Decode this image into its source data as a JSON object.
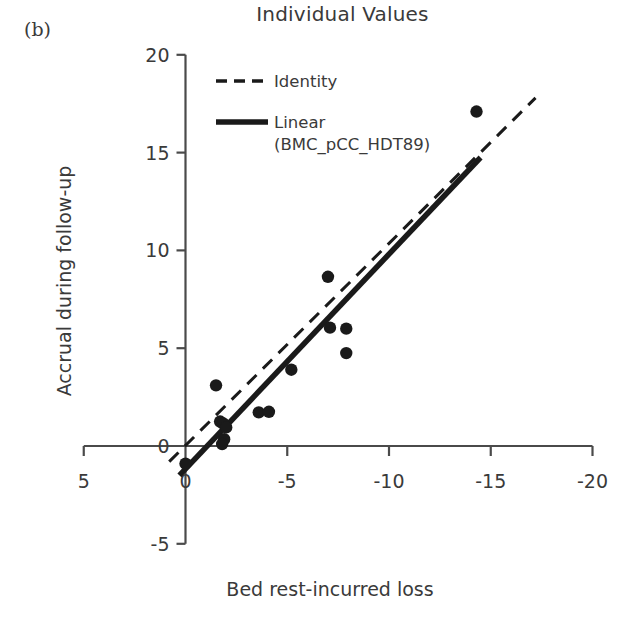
{
  "panel_label": "(b)",
  "chart_data": {
    "type": "scatter",
    "title": "Individual Values",
    "xlabel": "Bed rest-incurred loss",
    "ylabel": "Accrual during follow-up",
    "xlim": [
      5,
      -20
    ],
    "ylim": [
      -5,
      20
    ],
    "xticks": [
      5,
      0,
      -5,
      -10,
      -15,
      -20
    ],
    "xtick_labels": [
      "5",
      "0",
      "-5",
      "-10",
      "-15",
      "-20"
    ],
    "yticks": [
      20,
      15,
      10,
      5,
      0,
      -5
    ],
    "ytick_labels": [
      "20",
      "15",
      "10",
      "5",
      "0",
      "-5"
    ],
    "grid": false,
    "axis_direction": "x-reversed",
    "legend_position": "top-left-inside",
    "marker": "filled-circle",
    "marker_color": "#1a1a1a",
    "line_color": "#1a1a1a",
    "series": [
      {
        "name": "Individual Values",
        "type": "scatter",
        "points": [
          {
            "x": 0.0,
            "y": -0.9
          },
          {
            "x": -1.5,
            "y": 3.1
          },
          {
            "x": -1.7,
            "y": 1.25
          },
          {
            "x": -1.85,
            "y": 1.15
          },
          {
            "x": -2.0,
            "y": 0.95
          },
          {
            "x": -1.9,
            "y": 0.35
          },
          {
            "x": -1.8,
            "y": 0.1
          },
          {
            "x": -3.6,
            "y": 1.72
          },
          {
            "x": -4.1,
            "y": 1.75
          },
          {
            "x": -5.2,
            "y": 3.9
          },
          {
            "x": -7.0,
            "y": 8.65
          },
          {
            "x": -7.1,
            "y": 6.05
          },
          {
            "x": -7.9,
            "y": 6.0
          },
          {
            "x": -7.9,
            "y": 4.75
          },
          {
            "x": -14.3,
            "y": 17.1
          }
        ]
      },
      {
        "name": "Identity",
        "type": "line",
        "style": "dashed",
        "x": [
          0.8,
          -17.2
        ],
        "y": [
          -0.8,
          17.8
        ]
      },
      {
        "name": "Linear (BMC_pCC_HDT89)",
        "type": "line",
        "style": "solid",
        "x": [
          0.3,
          -14.5
        ],
        "y": [
          -1.5,
          14.75
        ]
      }
    ]
  },
  "legend": {
    "items": [
      {
        "label": "Identity",
        "style": "dashed"
      },
      {
        "label": "Linear",
        "sublabel": "(BMC_pCC_HDT89)",
        "style": "solid"
      }
    ]
  }
}
